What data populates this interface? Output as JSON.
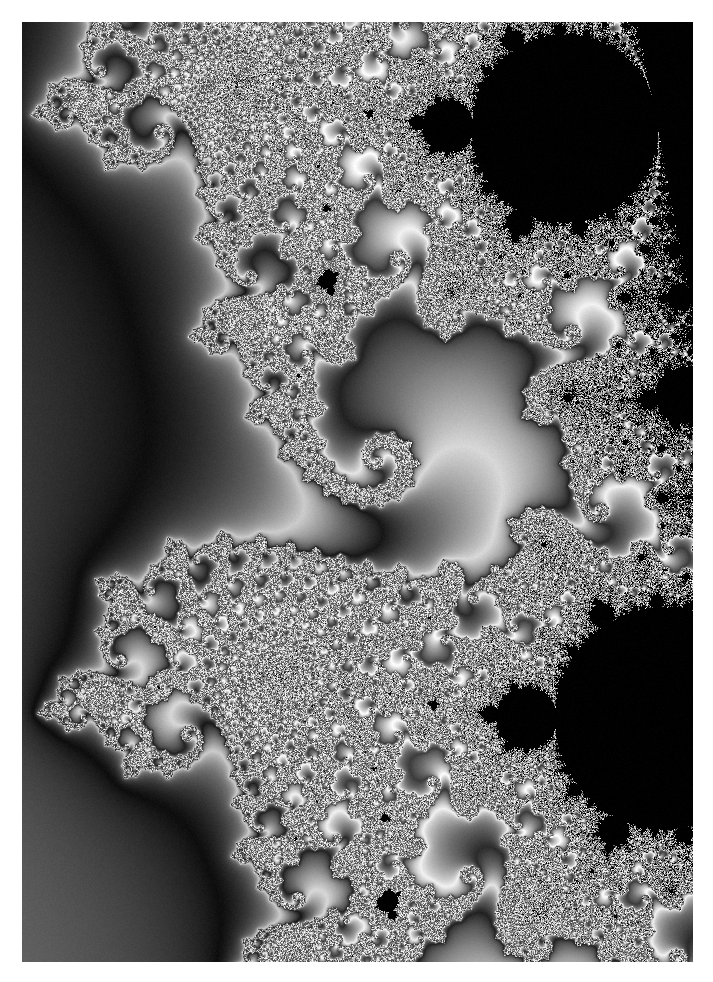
{
  "image": {
    "title": "Mandelbrot set detail",
    "kind": "fractal-render",
    "colormap": "grayscale",
    "background_color": "#5a5a5a",
    "border_color": "#ffffff",
    "border_px": 22,
    "plate": {
      "left": 22,
      "top": 22,
      "width": 671,
      "height": 940
    }
  },
  "chart_data": {
    "type": "heatmap",
    "title": "Mandelbrot set detail",
    "xlabel": "Re(c)",
    "ylabel": "Im(c)",
    "colormap": "grayscale",
    "render": {
      "center_re": -0.74364386269,
      "center_im": 0.13182590271,
      "scale_im": 0.0086,
      "max_iter": 900,
      "escape_radius": 64,
      "rotation_deg": 0,
      "smooth_coloring": true,
      "band_period": 13.5,
      "interior_color": "#000000",
      "gamma": 1.0,
      "width_px": 671,
      "height_px": 940,
      "noise_amount": 7
    },
    "palette_stops": [
      {
        "t": 0.0,
        "color": "#000000"
      },
      {
        "t": 0.1,
        "color": "#111111"
      },
      {
        "t": 0.22,
        "color": "#2e2e2e"
      },
      {
        "t": 0.36,
        "color": "#4f4f4f"
      },
      {
        "t": 0.5,
        "color": "#6e6e6e"
      },
      {
        "t": 0.62,
        "color": "#8f8f8f"
      },
      {
        "t": 0.74,
        "color": "#b2b2b2"
      },
      {
        "t": 0.86,
        "color": "#d6d6d6"
      },
      {
        "t": 0.94,
        "color": "#efefef"
      },
      {
        "t": 1.0,
        "color": "#ffffff"
      }
    ],
    "features": [
      {
        "name": "upper-left-bulb",
        "cx": 0.32,
        "cy": 0.2,
        "radius": 0.1
      },
      {
        "name": "main-upper-bulb",
        "cx": 0.37,
        "cy": 0.41,
        "radius": 0.155
      },
      {
        "name": "main-lower-bulb",
        "cx": 0.64,
        "cy": 0.64,
        "radius": 0.155
      },
      {
        "name": "left-arm-bulb",
        "cx": 0.14,
        "cy": 0.5,
        "radius": 0.065
      },
      {
        "name": "right-arm-bulb",
        "cx": 0.84,
        "cy": 0.56,
        "radius": 0.062
      },
      {
        "name": "lower-right-bulb",
        "cx": 0.69,
        "cy": 0.84,
        "radius": 0.078
      }
    ]
  }
}
